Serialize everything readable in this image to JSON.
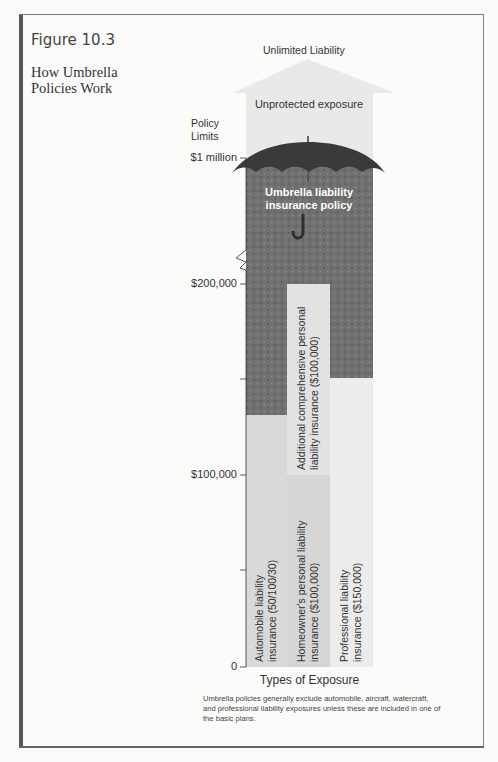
{
  "figure": {
    "number": "Figure 10.3",
    "title": "How Umbrella Policies Work"
  },
  "diagram": {
    "top_label": "Unlimited Liability",
    "unprotected_label": "Unprotected exposure",
    "umbrella_label": "Umbrella liability insurance policy",
    "y_axis_title": "Policy Limits",
    "y_ticks": [
      "$1 million",
      "$200,000",
      "",
      "$100,000",
      "",
      "0"
    ],
    "x_axis_title": "Types of Exposure",
    "columns": [
      {
        "label": "Automobile liability insurance (50/100/30)",
        "line1": "Automobile liability",
        "line2": "insurance (50/100/30)",
        "limit": 50000
      },
      {
        "label": "Homeowner's personal liability insurance ($100,000)",
        "line1": "Homeowner's personal liability",
        "line2": "insurance ($100,000)",
        "limit": 100000
      },
      {
        "label": "Professional liability insurance ($150,000)",
        "line1": "Professional liability",
        "line2": "insurance ($150,000)",
        "limit": 150000
      }
    ],
    "additional_layer": {
      "line1": "Additional comprehensive personal",
      "line2": "liability insurance ($100,000)",
      "limit": 100000
    },
    "note": "Umbrella policies generally exclude automobile, aircraft, watercraft, and professional liability exposures unless these are included in one of the basic plans.",
    "colors": {
      "unprotected": "#e9e9e9",
      "umbrella_fill": "#6f6f6f",
      "umbrella_canopy": "#3a3a3a",
      "base_policy": "#d9d9d9",
      "additional_policy": "#e3e3e3",
      "professional_policy": "#ececec",
      "axis": "#333333"
    }
  }
}
